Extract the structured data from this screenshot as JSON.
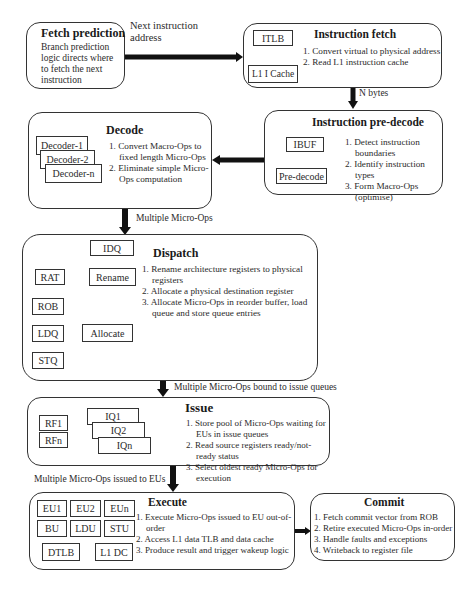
{
  "fetch_prediction": {
    "title": "Fetch prediction",
    "description": "Branch prediction logic directs where to fetch the next instruction"
  },
  "edge_fetch_to_ifetch": {
    "label_line1": "Next instruction",
    "label_line2": "address"
  },
  "instruction_fetch": {
    "title": "Instruction fetch",
    "blocks": {
      "itlb": "ITLB",
      "l1i": "L1 I Cache"
    },
    "steps": [
      "1. Convert virtual to physical address",
      "2. Read L1 instruction cache"
    ]
  },
  "edge_ifetch_to_predecode": {
    "label": "N bytes"
  },
  "instruction_predecode": {
    "title": "Instruction pre-decode",
    "blocks": {
      "ibuf": "IBUF",
      "predecode": "Pre-decode"
    },
    "steps": [
      "1. Detect instruction boundaries",
      "2. Identify instruction types",
      "3. Form Macro-Ops (optimise)"
    ]
  },
  "decode": {
    "title": "Decode",
    "blocks": {
      "d1": "Decoder-1",
      "d2": "Decoder-2",
      "dn": "Decoder-n"
    },
    "steps": [
      "1. Convert Macro-Ops to fixed length Micro-Ops",
      "2. Eliminate simple Micro-Ops computation"
    ]
  },
  "edge_decode_to_dispatch": {
    "label": "Multiple Micro-Ops"
  },
  "dispatch": {
    "title": "Dispatch",
    "blocks": {
      "idq": "IDQ",
      "rat": "RAT",
      "rename": "Rename",
      "rob": "ROB",
      "ldq": "LDQ",
      "allocate": "Allocate",
      "stq": "STQ"
    },
    "steps": [
      "1. Rename architecture registers to physical registers",
      "2. Allocate a physical destination register",
      "3. Allocate Micro-Ops in reorder buffer, load queue and store queue entries"
    ]
  },
  "edge_dispatch_to_issue": {
    "label": "Multiple Micro-Ops bound to issue queues"
  },
  "issue": {
    "title": "Issue",
    "blocks": {
      "rf1": "RF1",
      "rfn": "RFn",
      "iq1": "IQ1",
      "iq2": "IQ2",
      "iqn": "IQn"
    },
    "steps": [
      "1. Store pool of Micro-Ops waiting for EUs in issue queues",
      "2. Read source registers ready/not-ready status",
      "3. Select oldest ready Micro-Ops for execution"
    ]
  },
  "edge_issue_to_execute": {
    "label": "Multiple Micro-Ops issued to EUs"
  },
  "execute": {
    "title": "Execute",
    "blocks": {
      "eu1": "EU1",
      "eu2": "EU2",
      "eun": "EUn",
      "bu": "BU",
      "ldu": "LDU",
      "stu": "STU",
      "dtlb": "DTLB",
      "l1dc": "L1 DC"
    },
    "steps": [
      "1. Execute Micro-Ops issued to EU out-of-order",
      "2. Access L1 data TLB and data cache",
      "3. Produce result and trigger wakeup logic"
    ]
  },
  "commit": {
    "title": "Commit",
    "steps": [
      "1. Fetch commit vector from ROB",
      "2. Retire executed Micro-Ops in-order",
      "3. Handle faults and exceptions",
      "4. Writeback to register file"
    ]
  }
}
